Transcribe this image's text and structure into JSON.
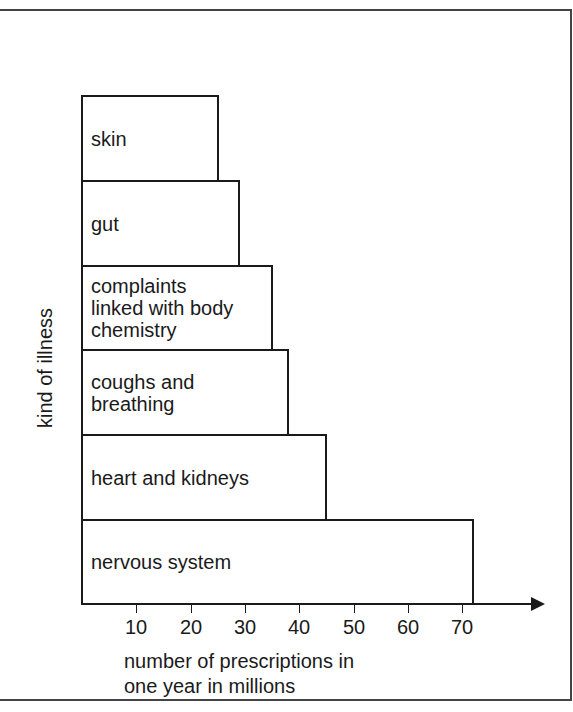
{
  "chart_data": {
    "type": "bar",
    "orientation": "horizontal",
    "title": "",
    "xlabel": "number of prescriptions in\none year in millions",
    "ylabel": "kind of illness",
    "categories": [
      "skin",
      "gut",
      "complaints\nlinked with body\nchemistry",
      "coughs and\nbreathing",
      "heart and kidneys",
      "nervous system"
    ],
    "values": [
      25,
      29,
      35,
      38,
      45,
      72
    ],
    "xticks": [
      10,
      20,
      30,
      40,
      50,
      60,
      70
    ],
    "xlim": [
      0,
      80
    ],
    "grid": false,
    "legend": null
  },
  "layout": {
    "origin_x": 82,
    "px_per_unit": 5.43,
    "axis_y": 604,
    "bar_tops": [
      95,
      180,
      265,
      349,
      434,
      519
    ],
    "bar_bottom": 604
  }
}
